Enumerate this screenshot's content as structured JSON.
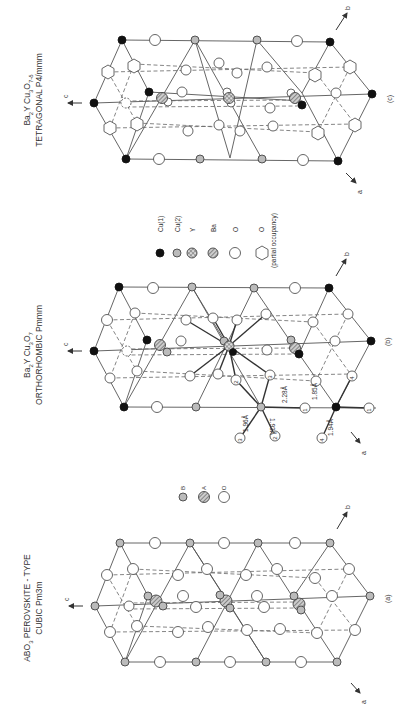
{
  "figure": {
    "panels": [
      {
        "id": "c",
        "label": "(c)",
        "formula_main": "Ba",
        "formula_parts": [
          "Ba",
          "2",
          "Y Cu",
          "3",
          "O",
          "7-δ"
        ],
        "formula_text": "Ba2YCu3O7-δ",
        "structure_line": "TETRAGONAL  P4/mmm",
        "axes": {
          "c": "c",
          "a": "a",
          "b": "b"
        }
      },
      {
        "id": "b",
        "label": "(b)",
        "formula_parts": [
          "Ba",
          "2",
          "Y Cu",
          "3",
          "O",
          "7"
        ],
        "formula_text": "Ba2YCu3O7",
        "structure_line": "ORTHORHOMBIC  Pmmm",
        "axes": {
          "c": "c",
          "a": "a",
          "b": "b"
        },
        "bond_lengths": [
          "1.96Å",
          "1.93Å",
          "2.28Å",
          "1.85Å",
          "1.94Å"
        ],
        "oxygen_site_labels": [
          "1",
          "1",
          "2",
          "2",
          "3",
          "3",
          "4",
          "4"
        ]
      },
      {
        "id": "a",
        "label": "(a)",
        "formula_parts": [
          "ABO",
          "3",
          " PEROVSKITE - TYPE"
        ],
        "formula_text": "ABO3 PEROVSKITE-TYPE",
        "structure_line": "CUBIC  Pm3m",
        "axes": {
          "c": "c",
          "a": "a",
          "b": "b"
        }
      }
    ],
    "legend_ybco": [
      {
        "symbol": "filled-black-circle",
        "label": "Cu(1)"
      },
      {
        "symbol": "gray-circle",
        "label": "Cu(2)"
      },
      {
        "symbol": "crosshatched-circle",
        "label": "Y"
      },
      {
        "symbol": "hatched-circle",
        "label": "Ba"
      },
      {
        "symbol": "open-circle",
        "label": "O"
      },
      {
        "symbol": "open-hexagon",
        "label": "O"
      }
    ],
    "legend_ybco_note": "(partial occupancy)",
    "legend_perovskite": [
      {
        "symbol": "gray-circle",
        "label": "B"
      },
      {
        "symbol": "hatched-circle",
        "label": "A"
      },
      {
        "symbol": "open-circle",
        "label": "O"
      }
    ],
    "colors": {
      "cu1": "#111111",
      "cu2": "#bbbbbb",
      "line": "#555555",
      "background": "#ffffff"
    }
  }
}
